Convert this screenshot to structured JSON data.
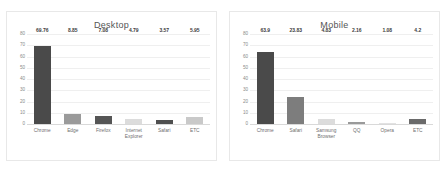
{
  "chart_data": [
    {
      "type": "bar",
      "title": "Desktop",
      "categories": [
        "Chrome",
        "Edge",
        "Firefox",
        "Internet Explorer",
        "Safari",
        "ETC"
      ],
      "values": [
        69.76,
        8.85,
        7.08,
        4.79,
        3.57,
        5.95
      ],
      "value_labels": [
        "69.76",
        "8.85",
        "7.08",
        "4.79",
        "3.57",
        "5.95"
      ],
      "bar_colors": [
        "#4a4a4a",
        "#9a9a9a",
        "#555555",
        "#dcdcdc",
        "#4f4f4f",
        "#c9c9c9"
      ],
      "xlabel": "",
      "ylabel": "",
      "ylim": [
        0,
        80
      ],
      "yticks": [
        80,
        70,
        60,
        50,
        40,
        30,
        20,
        10,
        0
      ],
      "ytick_labels": [
        "80",
        "70",
        "60",
        "50",
        "40",
        "30",
        "20",
        "10",
        "0"
      ],
      "grid": true,
      "legend": false
    },
    {
      "type": "bar",
      "title": "Mobile",
      "categories": [
        "Chrome",
        "Safari",
        "Samsung Browser",
        "QQ",
        "Opera",
        "ETC"
      ],
      "values": [
        63.9,
        23.83,
        4.83,
        2.16,
        1.08,
        4.2
      ],
      "value_labels": [
        "63.9",
        "23.83",
        "4.83",
        "2.16",
        "1.08",
        "4.2"
      ],
      "bar_colors": [
        "#4a4a4a",
        "#7d7d7d",
        "#dcdcdc",
        "#9a9a9a",
        "#e2e2e2",
        "#6a6a6a"
      ],
      "xlabel": "",
      "ylabel": "",
      "ylim": [
        0,
        80
      ],
      "yticks": [
        80,
        70,
        60,
        50,
        40,
        30,
        20,
        10,
        0
      ],
      "ytick_labels": [
        "80",
        "70",
        "60",
        "50",
        "40",
        "30",
        "20",
        "10",
        "0"
      ],
      "grid": true,
      "legend": false
    }
  ],
  "theme": {
    "background": "#ffffff",
    "panel_border": "#e8e8e8",
    "grid_color": "#efefef",
    "axis_color": "#d9d9d9",
    "title_color": "#555555",
    "tick_color": "#8a8a8a",
    "label_color": "#6f6f6f",
    "value_color": "#3d3d3d"
  }
}
